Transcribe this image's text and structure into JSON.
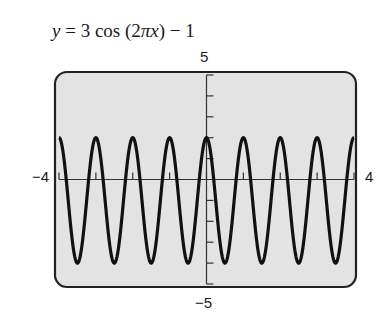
{
  "chart_data": {
    "type": "line",
    "title": "y = 3 cos (2πx) − 1",
    "function": "y = 3*cos(2*pi*x) - 1",
    "xlabel": "",
    "ylabel": "",
    "xlim": [
      -4,
      4
    ],
    "ylim": [
      -5,
      5
    ],
    "x_tick_step": 1,
    "y_tick_step": 1,
    "grid": false,
    "legend": null,
    "window_labels": {
      "xmin": "−4",
      "xmax": "4",
      "ymin": "−5",
      "ymax": "5"
    },
    "series": [
      {
        "name": "y = 3cos(2πx) − 1",
        "amplitude": 3,
        "period": 1,
        "vertical_shift": -1,
        "max": 2,
        "min": -4,
        "x": [
          -4,
          -3.5,
          -3,
          -2.5,
          -2,
          -1.5,
          -1,
          -0.5,
          0,
          0.5,
          1,
          1.5,
          2,
          2.5,
          3,
          3.5,
          4
        ],
        "values": [
          2,
          -4,
          2,
          -4,
          2,
          -4,
          2,
          -4,
          2,
          -4,
          2,
          -4,
          2,
          -4,
          2,
          -4,
          2
        ]
      }
    ]
  },
  "equation": {
    "lhs": "y",
    "rhs_parts": [
      "3 cos (2",
      "π",
      "x",
      ") − 1"
    ]
  },
  "colors": {
    "screen_bg": "#e3e3e3",
    "curve": "#111111",
    "frame": "#222222",
    "axis": "#333333"
  }
}
